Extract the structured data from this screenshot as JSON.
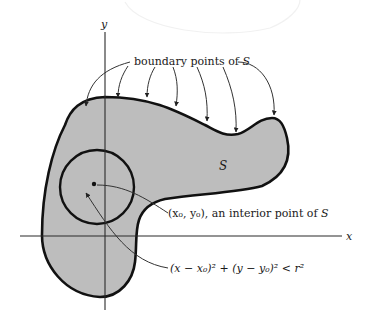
{
  "figure": {
    "axes": {
      "x_label": "x",
      "y_label": "y"
    },
    "region_label": "S",
    "labels": {
      "boundary": {
        "text": "boundary points of ",
        "set": "S"
      },
      "interior_point": {
        "text": "(x₀, y₀), an interior point of ",
        "set": "S"
      },
      "disk_inequality": "(x − x₀)² + (y − y₀)² < r²"
    },
    "boundary_arrow_count": 7,
    "colors": {
      "region_fill": "#bdbdbd",
      "outline": "#111111",
      "text": "#1a1a1a"
    }
  }
}
